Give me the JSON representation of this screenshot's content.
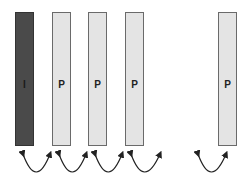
{
  "diagram": {
    "frames": [
      {
        "type": "I",
        "label": "I",
        "x": 15
      },
      {
        "type": "P",
        "label": "P",
        "x": 52
      },
      {
        "type": "P",
        "label": "P",
        "x": 88
      },
      {
        "type": "P",
        "label": "P",
        "x": 125
      },
      {
        "type": "P",
        "label": "P",
        "x": 218
      }
    ],
    "colors": {
      "i_frame_fill": "#4a4a4a",
      "p_frame_fill": "#e4e4e4",
      "border": "#6a6a6a",
      "arrow": "#222222"
    },
    "arrows_description": "Bidirectional curved arrows connecting adjacent frames beneath each pair"
  }
}
